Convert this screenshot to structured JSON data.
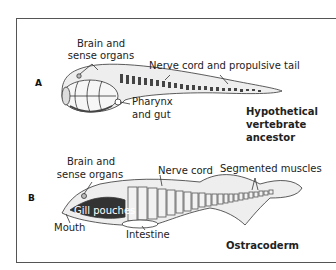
{
  "figure": {
    "panels": [
      {
        "letter": "A",
        "caption_lines": [
          "Hypothetical",
          "vertebrate",
          "ancestor"
        ],
        "labels": {
          "brain_line1": "Brain and",
          "brain_line2": "sense organs",
          "nerve_cord": "Nerve cord and propulsive tail",
          "pharynx_line1": "Pharynx",
          "pharynx_line2": "and gut"
        }
      },
      {
        "letter": "B",
        "caption_lines": [
          "Ostracoderm"
        ],
        "labels": {
          "brain_line1": "Brain and",
          "brain_line2": "sense organs",
          "nerve_cord": "Nerve cord",
          "segmented_muscles": "Segmented muscles",
          "gill_pouches": "Gill pouches",
          "mouth": "Mouth",
          "intestine": "Intestine"
        }
      }
    ]
  }
}
